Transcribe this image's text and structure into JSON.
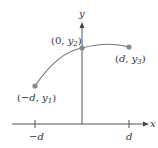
{
  "diagram": {
    "type": "coordinate-plot",
    "axes": {
      "x_label": "x",
      "y_label": "y",
      "x_ticks": [
        "−d",
        "d"
      ]
    },
    "points": [
      {
        "label_open": "(−",
        "label_var": "d",
        "label_mid": ", ",
        "label_y": "y",
        "label_sub": "1",
        "label_close": ")"
      },
      {
        "label_open": "(0, ",
        "label_y": "y",
        "label_sub": "2",
        "label_close": ")"
      },
      {
        "label_open": "(",
        "label_var": "d",
        "label_mid": ", ",
        "label_y": "y",
        "label_sub": "3",
        "label_close": ")"
      }
    ],
    "colors": {
      "axis": "#555555",
      "curve": "#777777",
      "point": "#888888",
      "text": "#333333"
    }
  }
}
